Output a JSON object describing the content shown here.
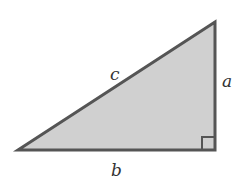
{
  "diagram": {
    "type": "right-triangle",
    "vertices": {
      "left": [
        18,
        150
      ],
      "right_angle": [
        215,
        150
      ],
      "top": [
        215,
        22
      ]
    },
    "labels": {
      "hypotenuse": "c",
      "vertical_leg": "a",
      "horizontal_leg": "b"
    },
    "right_angle_marker": true,
    "colors": {
      "fill": "#d0d0d0",
      "stroke": "#555555",
      "label": "#333333"
    }
  }
}
